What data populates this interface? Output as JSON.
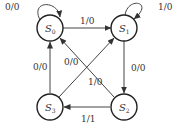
{
  "diagram": {
    "type": "state-transition-diagram",
    "states": [
      {
        "id": "S0",
        "label": "S",
        "sub": "0"
      },
      {
        "id": "S1",
        "label": "S",
        "sub": "1"
      },
      {
        "id": "S2",
        "label": "S",
        "sub": "2"
      },
      {
        "id": "S3",
        "label": "S",
        "sub": "3"
      }
    ],
    "transitions": [
      {
        "from": "S0",
        "to": "S0",
        "label": "0/0"
      },
      {
        "from": "S0",
        "to": "S1",
        "label": "1/0"
      },
      {
        "from": "S1",
        "to": "S1",
        "label": "1/0"
      },
      {
        "from": "S1",
        "to": "S2",
        "label": "0/0"
      },
      {
        "from": "S2",
        "to": "S3",
        "label": "1/1"
      },
      {
        "from": "S3",
        "to": "S0",
        "label": "0/0"
      },
      {
        "from": "S2",
        "to": "S0",
        "label": "0/0"
      },
      {
        "from": "S3",
        "to": "S1",
        "label": "1/0"
      }
    ]
  }
}
